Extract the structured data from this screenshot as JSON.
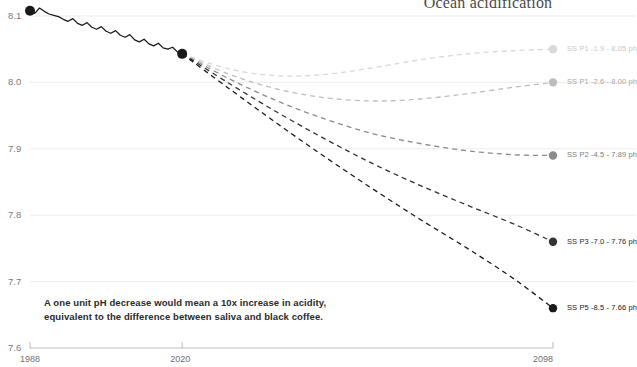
{
  "title": "Ocean acidification",
  "annotation": {
    "line1": "A one unit pH decrease would mean a 10x increase in acidity,",
    "line2": "equivalent to the difference between saliva and black coffee."
  },
  "axes": {
    "y_ticks": [
      "8.1",
      "8.0",
      "7.9",
      "7.8",
      "7.7",
      "7.6"
    ],
    "x_ticks": [
      "1988",
      "2020",
      "2098"
    ]
  },
  "legend": [
    {
      "label": "SS P1 -1.9 - 8.05 ph",
      "color": "#d9d9d9"
    },
    {
      "label": "SS P1 -2.6 - 8.00 ph",
      "color": "#bdbdbd"
    },
    {
      "label": "SS P2 -4.5 - 7.89 ph",
      "color": "#8c8c8c"
    },
    {
      "label": "SS P3 -7.0 - 7.76 ph",
      "color": "#333333"
    },
    {
      "label": "SS P5 -8.5 - 7.66 ph",
      "color": "#1a1a1a"
    }
  ],
  "chart_data": {
    "type": "line",
    "title": "Ocean acidification",
    "xlabel": "",
    "ylabel": "pH",
    "xlim": [
      1988,
      2098
    ],
    "ylim": [
      7.6,
      8.1
    ],
    "grid": true,
    "legend_position": "right",
    "annotation": "A one unit pH decrease would mean a 10x increase in acidity, equivalent to the difference between saliva and black coffee.",
    "historical": {
      "name": "Observed ocean surface pH",
      "color": "#1a1a1a",
      "style": "solid",
      "x": [
        1988,
        1989,
        1990,
        1991,
        1992,
        1993,
        1994,
        1995,
        1996,
        1997,
        1998,
        1999,
        2000,
        2001,
        2002,
        2003,
        2004,
        2005,
        2006,
        2007,
        2008,
        2009,
        2010,
        2011,
        2012,
        2013,
        2014,
        2015,
        2016,
        2017,
        2018,
        2019,
        2020
      ],
      "y": [
        8.108,
        8.104,
        8.112,
        8.107,
        8.103,
        8.101,
        8.099,
        8.095,
        8.092,
        8.096,
        8.089,
        8.086,
        8.09,
        8.083,
        8.08,
        8.084,
        8.077,
        8.074,
        8.078,
        8.071,
        8.068,
        8.072,
        8.064,
        8.061,
        8.065,
        8.058,
        8.055,
        8.059,
        8.052,
        8.05,
        8.053,
        8.046,
        8.043
      ],
      "endpoint_markers": [
        {
          "x": 1988,
          "y": 8.108
        },
        {
          "x": 2020,
          "y": 8.043
        }
      ]
    },
    "series": [
      {
        "name": "SS P1 -1.9 - 8.05 ph",
        "label": "SS P1 -1.9 - 8.05 ph",
        "color": "#d9d9d9",
        "style": "dashed",
        "end_value": 8.05,
        "x": [
          2020,
          2030,
          2040,
          2050,
          2060,
          2070,
          2080,
          2090,
          2098
        ],
        "y": [
          8.043,
          8.02,
          8.01,
          8.012,
          8.022,
          8.034,
          8.043,
          8.048,
          8.05
        ]
      },
      {
        "name": "SS P1 -2.6 - 8.00 ph",
        "label": "SS P1 -2.6 - 8.00 ph",
        "color": "#bdbdbd",
        "style": "dashed",
        "end_value": 8.0,
        "x": [
          2020,
          2030,
          2040,
          2050,
          2060,
          2070,
          2080,
          2090,
          2098
        ],
        "y": [
          8.043,
          8.012,
          7.99,
          7.977,
          7.972,
          7.975,
          7.983,
          7.993,
          8.0
        ]
      },
      {
        "name": "SS P2 -4.5 - 7.89 ph",
        "label": "SS P2 -4.5 - 7.89 ph",
        "color": "#8c8c8c",
        "style": "dashed",
        "end_value": 7.89,
        "x": [
          2020,
          2030,
          2040,
          2050,
          2060,
          2070,
          2080,
          2090,
          2098
        ],
        "y": [
          8.043,
          8.005,
          7.972,
          7.945,
          7.923,
          7.908,
          7.897,
          7.891,
          7.89
        ]
      },
      {
        "name": "SS P3 -7.0 - 7.76 ph",
        "label": "SS P3 -7.0 - 7.76 ph",
        "color": "#333333",
        "style": "dashed",
        "end_value": 7.76,
        "x": [
          2020,
          2030,
          2040,
          2050,
          2060,
          2070,
          2080,
          2090,
          2098
        ],
        "y": [
          8.043,
          7.998,
          7.955,
          7.915,
          7.878,
          7.845,
          7.815,
          7.786,
          7.76
        ]
      },
      {
        "name": "SS P5 -8.5 - 7.66 ph",
        "label": "SS P5 -8.5 - 7.66 ph",
        "color": "#1a1a1a",
        "style": "dashed",
        "end_value": 7.66,
        "x": [
          2020,
          2030,
          2040,
          2050,
          2060,
          2070,
          2080,
          2090,
          2098
        ],
        "y": [
          8.043,
          7.99,
          7.938,
          7.888,
          7.84,
          7.794,
          7.75,
          7.703,
          7.66
        ]
      }
    ]
  }
}
